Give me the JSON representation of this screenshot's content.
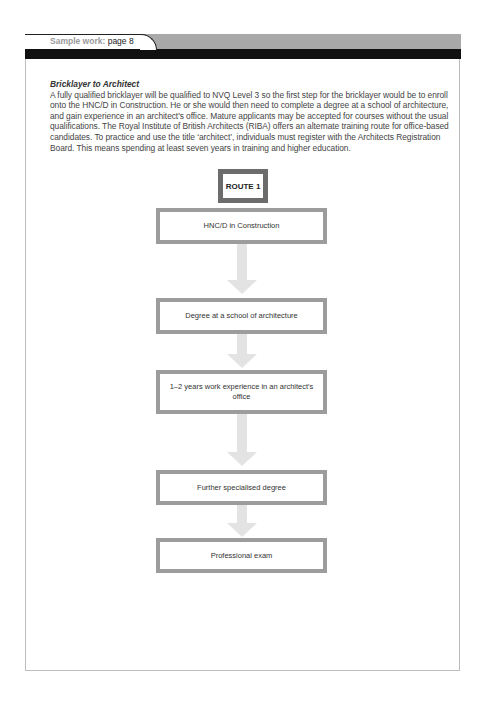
{
  "header": {
    "tab_prefix": "Sample work:",
    "tab_page": "page 8"
  },
  "article": {
    "title": "Bricklayer to Architect",
    "body": "A fully qualified bricklayer will be qualified to NVQ Level 3 so the first step for the bricklayer would be to enroll onto the HNC/D in Construction. He or she would then need to complete a degree at a school of architecture, and gain experience in an architect's office. Mature applicants may be accepted for courses without the usual qualifications. The Royal Institute of British Architects (RIBA) offers an alternate training route for office-based candidates. To practice and use the title ‘architect’, individuals must register with the Architects Registration Board. This means spending at least seven years in training and higher education."
  },
  "flowchart": {
    "route_label": "ROUTE 1",
    "steps": [
      {
        "label": "HNC/D in Construction"
      },
      {
        "label": "Degree at a school of architecture"
      },
      {
        "label": "1–2 years work experience in an architect's office"
      },
      {
        "label": "Further specialised degree"
      },
      {
        "label": "Professional exam"
      }
    ],
    "colors": {
      "route_border": "#6c6c6c",
      "step_border": "#9c9c9c",
      "arrow": "#e3e3e3"
    }
  }
}
